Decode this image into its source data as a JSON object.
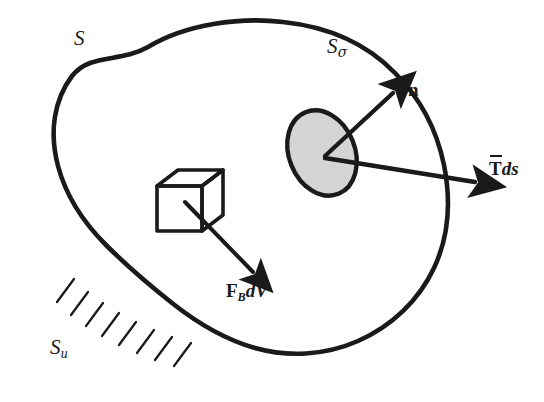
{
  "figure": {
    "name": "continuum-body-free-body-diagram",
    "background_color": "#ffffff",
    "ink_color": "#1a1a1a",
    "patch_fill_color": "#d4d4d4"
  },
  "labels": {
    "total_surface": "S",
    "traction_surface_base": "S",
    "traction_surface_sub": "σ",
    "displacement_surface_base": "S",
    "displacement_surface_sub": "u",
    "normal_vector": "n",
    "body_force_base": "F",
    "body_force_sub": "B",
    "body_force_tail": "dV",
    "traction_base": "T",
    "traction_tail": "ds"
  },
  "elements": {
    "body_outline": "closed-irregular-blob",
    "surface_patch": "shaded-ellipse",
    "volume_element": "wireframe-cube",
    "fixed_support": "hatched-boundary",
    "hatch_count": 8,
    "arrows": [
      {
        "name": "normal-arrow",
        "label": "n",
        "direction": "up-right"
      },
      {
        "name": "traction-arrow",
        "label": "Tds",
        "direction": "right"
      },
      {
        "name": "body-force-arrow",
        "label": "FBdV",
        "direction": "down-right"
      }
    ]
  }
}
